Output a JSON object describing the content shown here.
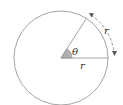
{
  "diagram": {
    "circle": {
      "cx": 61,
      "cy": 58,
      "r": 47,
      "stroke": "#9a9a9a"
    },
    "radius_horizontal_label": "r",
    "arc_label": "r",
    "angle_label": "θ",
    "angle_wedge_fill": "#b0b0b0",
    "arrow_color": "#555555"
  }
}
